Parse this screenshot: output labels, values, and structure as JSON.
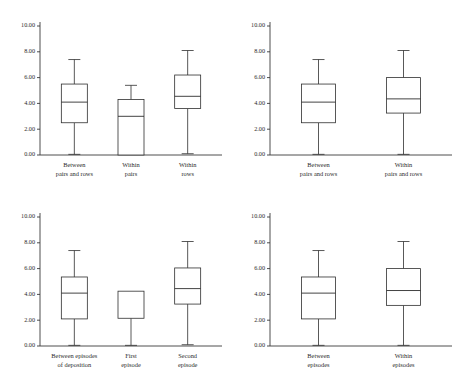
{
  "figure": {
    "background": "#ffffff",
    "line_color": "#2e2e2e",
    "panel_count": 4
  },
  "chart_data": [
    {
      "type": "box",
      "panel": "top-left",
      "title": "",
      "xlabel": "",
      "ylabel": "",
      "ylim": [
        0,
        10
      ],
      "yticks": [
        0,
        2,
        4,
        6,
        8,
        10
      ],
      "ytick_labels": [
        "0.00",
        "2.00",
        "4.00",
        "6.00",
        "8.00",
        "10.00"
      ],
      "grid": false,
      "legend": "none",
      "categories": [
        "Between pairs and rows",
        "Within pairs",
        "Within rows"
      ],
      "category_lines": [
        [
          "Between",
          "pairs and rows"
        ],
        [
          "Within",
          "pairs"
        ],
        [
          "Within",
          "rows"
        ]
      ],
      "boxes": [
        {
          "label": "Between pairs and rows",
          "whisker_low": 0.05,
          "q1": 2.5,
          "median": 4.1,
          "q3": 5.5,
          "whisker_high": 7.4
        },
        {
          "label": "Within pairs",
          "whisker_low": 0.0,
          "q1": 0.0,
          "median": 3.0,
          "q3": 4.3,
          "whisker_high": 5.4
        },
        {
          "label": "Within rows",
          "whisker_low": 0.1,
          "q1": 3.6,
          "median": 4.55,
          "q3": 6.2,
          "whisker_high": 8.1
        }
      ]
    },
    {
      "type": "box",
      "panel": "top-right",
      "title": "",
      "xlabel": "",
      "ylabel": "",
      "ylim": [
        0,
        10
      ],
      "yticks": [
        0,
        2,
        4,
        6,
        8,
        10
      ],
      "ytick_labels": [
        "0.00",
        "2.00",
        "4.00",
        "6.00",
        "8.00",
        "10.00"
      ],
      "grid": false,
      "legend": "none",
      "categories": [
        "Between pairs and rows",
        "Within pairs and rows"
      ],
      "category_lines": [
        [
          "Between",
          "pairs and rows"
        ],
        [
          "Within",
          "pairs and rows"
        ]
      ],
      "boxes": [
        {
          "label": "Between pairs and rows",
          "whisker_low": 0.05,
          "q1": 2.5,
          "median": 4.1,
          "q3": 5.5,
          "whisker_high": 7.4
        },
        {
          "label": "Within pairs and rows",
          "whisker_low": 0.05,
          "q1": 3.25,
          "median": 4.35,
          "q3": 6.0,
          "whisker_high": 8.1
        }
      ]
    },
    {
      "type": "box",
      "panel": "bottom-left",
      "title": "",
      "xlabel": "",
      "ylabel": "",
      "ylim": [
        0,
        10
      ],
      "yticks": [
        0,
        2,
        4,
        6,
        8,
        10
      ],
      "ytick_labels": [
        "0.00",
        "2.00",
        "4.00",
        "6.00",
        "8.00",
        "10.00"
      ],
      "grid": false,
      "legend": "none",
      "categories": [
        "Between episodes of deposition",
        "First episode",
        "Second episode"
      ],
      "category_lines": [
        [
          "Between episodes",
          "of deposition"
        ],
        [
          "First",
          "episode"
        ],
        [
          "Second",
          "episode"
        ]
      ],
      "boxes": [
        {
          "label": "Between episodes of deposition",
          "whisker_low": 0.05,
          "q1": 2.1,
          "median": 4.1,
          "q3": 5.35,
          "whisker_high": 7.4
        },
        {
          "label": "First episode",
          "whisker_low": 0.05,
          "q1": 2.15,
          "median": null,
          "q3": 4.25,
          "whisker_high": null
        },
        {
          "label": "Second episode",
          "whisker_low": 0.1,
          "q1": 3.25,
          "median": 4.45,
          "q3": 6.05,
          "whisker_high": 8.1
        }
      ]
    },
    {
      "type": "box",
      "panel": "bottom-right",
      "title": "",
      "xlabel": "",
      "ylabel": "",
      "ylim": [
        0,
        10
      ],
      "yticks": [
        0,
        2,
        4,
        6,
        8,
        10
      ],
      "ytick_labels": [
        "0.00",
        "2.00",
        "4.00",
        "6.00",
        "8.00",
        "10.00"
      ],
      "grid": false,
      "legend": "none",
      "categories": [
        "Between episodes",
        "Within episodes"
      ],
      "category_lines": [
        [
          "Between",
          "episodes"
        ],
        [
          "Within",
          "episodes"
        ]
      ],
      "boxes": [
        {
          "label": "Between episodes",
          "whisker_low": 0.05,
          "q1": 2.1,
          "median": 4.1,
          "q3": 5.35,
          "whisker_high": 7.4
        },
        {
          "label": "Within episodes",
          "whisker_low": 0.05,
          "q1": 3.15,
          "median": 4.3,
          "q3": 6.0,
          "whisker_high": 8.1
        }
      ]
    }
  ]
}
